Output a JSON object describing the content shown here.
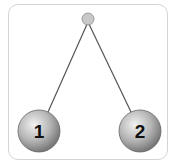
{
  "diagram": {
    "pivot": {
      "cx": 88,
      "cy": 19,
      "r": 6,
      "color": "#c8c8c8"
    },
    "strings": [
      {
        "x1": 88,
        "y1": 22,
        "x2": 48,
        "y2": 112
      },
      {
        "x1": 88,
        "y1": 22,
        "x2": 131,
        "y2": 112
      }
    ],
    "balls": [
      {
        "label": "1",
        "cx": 39,
        "cy": 131,
        "r": 21
      },
      {
        "label": "2",
        "cx": 140,
        "cy": 131,
        "r": 21
      }
    ],
    "colors": {
      "frame_border": "#d4d4d4",
      "string": "#555555",
      "ball_light": "#e8e8e8",
      "ball_dark": "#7a7a7a"
    }
  }
}
